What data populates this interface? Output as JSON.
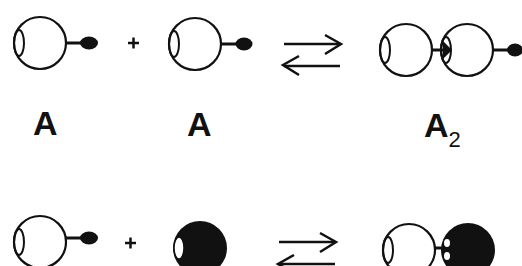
{
  "diagram": {
    "background": "#ffffff",
    "ink_color": "#111111",
    "reaction_1": {
      "reactant_1": {
        "label": "A",
        "shape": "open-sphere-with-tail"
      },
      "operator": "+",
      "reactant_2": {
        "label": "A",
        "shape": "open-sphere-with-tail"
      },
      "arrow": "reversible-equilibrium-arrows",
      "product": {
        "label": "A",
        "label_subscript": "2",
        "shape": "dimer-open-spheres"
      }
    },
    "reaction_2": {
      "reactant_1": {
        "label": "",
        "shape": "open-sphere-with-tail"
      },
      "operator": "+",
      "reactant_2": {
        "label": "",
        "shape": "filled-black-sphere"
      },
      "arrow": "reversible-equilibrium-arrows",
      "product": {
        "label": "",
        "shape": "open-sphere-bound-to-black-sphere"
      }
    }
  }
}
